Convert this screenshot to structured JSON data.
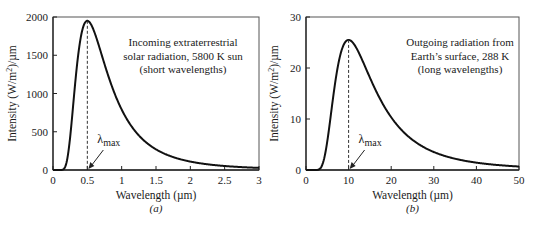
{
  "figure": {
    "panels": [
      "(a)",
      "(b)"
    ]
  },
  "chart_data": [
    {
      "type": "line",
      "panel_label": "(a)",
      "title": "",
      "annotation": [
        "Incoming extraterrestrial",
        "solar radiation, 5800 K sun",
        "(short wavelengths)"
      ],
      "xlabel": "Wavelength (µm)",
      "ylabel": "Intensity (W/m²)/µm",
      "xlim": [
        0,
        3
      ],
      "ylim": [
        0,
        2000
      ],
      "xticks": [
        0,
        0.5,
        1,
        1.5,
        2,
        2.5,
        3
      ],
      "xtick_labels": [
        "0",
        "0.5",
        "1",
        "1.5",
        "2",
        "2.5",
        "3"
      ],
      "yticks": [
        0,
        500,
        1000,
        1500,
        2000
      ],
      "ytick_labels": [
        "0",
        "500",
        "1000",
        "1500",
        "2000"
      ],
      "grid": false,
      "temperature_K": 5800,
      "peak": {
        "x": 0.5,
        "y": 1950
      },
      "marker": {
        "label": "λ",
        "sub": "max",
        "x": 0.5
      },
      "series": [
        {
          "name": "Blackbody 5800 K",
          "x": [
            0.1,
            0.15,
            0.2,
            0.25,
            0.3,
            0.35,
            0.4,
            0.45,
            0.5,
            0.6,
            0.7,
            0.8,
            1.0,
            1.25,
            1.5,
            2.0,
            2.5,
            3.0
          ],
          "y": [
            0,
            40,
            330,
            840,
            1320,
            1680,
            1890,
            1950,
            1950,
            1770,
            1500,
            1230,
            810,
            480,
            300,
            130,
            65,
            35
          ]
        }
      ]
    },
    {
      "type": "line",
      "panel_label": "(b)",
      "title": "",
      "annotation": [
        "Outgoing radiation from",
        "Earth’s surface, 288 K",
        "(long wavelengths)"
      ],
      "xlabel": "Wavelength (µm)",
      "ylabel": "Intensity (W/m²)/µm",
      "xlim": [
        0,
        50
      ],
      "ylim": [
        0,
        30
      ],
      "xticks": [
        0,
        10,
        20,
        30,
        40,
        50
      ],
      "xtick_labels": [
        "0",
        "10",
        "20",
        "30",
        "40",
        "50"
      ],
      "yticks": [
        0,
        10,
        20,
        30
      ],
      "ytick_labels": [
        "0",
        "10",
        "20",
        "30"
      ],
      "grid": false,
      "temperature_K": 288,
      "peak": {
        "x": 10,
        "y": 25.5
      },
      "marker": {
        "label": "λ",
        "sub": "max",
        "x": 10
      },
      "series": [
        {
          "name": "Blackbody 288 K",
          "x": [
            2.5,
            3,
            4,
            5,
            6,
            7,
            8,
            9,
            10,
            12,
            14,
            16,
            20,
            25,
            30,
            35,
            40,
            50
          ],
          "y": [
            0,
            0.3,
            3.3,
            9.3,
            15.3,
            20,
            23.3,
            25,
            25.5,
            24.6,
            22,
            19,
            13.3,
            8.3,
            5.3,
            3.4,
            2.3,
            1.0
          ]
        }
      ]
    }
  ]
}
